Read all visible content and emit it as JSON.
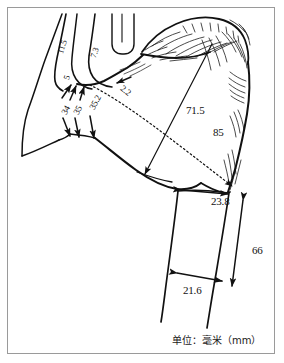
{
  "figure": {
    "frame_color": "#9a9a9a",
    "ink_color": "#111111",
    "background_color": "#ffffff",
    "units_caption": "单位：毫米（mm）"
  },
  "dimensions": [
    {
      "id": "d-11-5",
      "value": "11.5",
      "rotation": -72,
      "x": 56,
      "y": 52,
      "size": 8.5
    },
    {
      "id": "d-7-3",
      "value": "7.3",
      "rotation": -70,
      "x": 89,
      "y": 56,
      "size": 8.5
    },
    {
      "id": "d-5",
      "value": "5",
      "rotation": -72,
      "x": 62,
      "y": 78,
      "size": 8.5
    },
    {
      "id": "d-2-2",
      "value": "2.2",
      "rotation": 38,
      "x": 124,
      "y": 84,
      "size": 9
    },
    {
      "id": "d-34",
      "value": "34",
      "rotation": -62,
      "x": 60,
      "y": 112,
      "size": 9
    },
    {
      "id": "d-35",
      "value": "35",
      "rotation": -62,
      "x": 72,
      "y": 112,
      "size": 9
    },
    {
      "id": "d-35-2",
      "value": "35.2",
      "rotation": -62,
      "x": 88,
      "y": 107,
      "size": 9
    },
    {
      "id": "d-71-5",
      "value": "71.5",
      "rotation": 0,
      "x": 186,
      "y": 105,
      "size": 11
    },
    {
      "id": "d-85",
      "value": "85",
      "rotation": 0,
      "x": 213,
      "y": 127,
      "size": 11
    },
    {
      "id": "d-23-8",
      "value": "23.8",
      "rotation": 0,
      "x": 211,
      "y": 196,
      "size": 11
    },
    {
      "id": "d-66",
      "value": "66",
      "rotation": 0,
      "x": 252,
      "y": 245,
      "size": 11
    },
    {
      "id": "d-21-6",
      "value": "21.6",
      "rotation": 0,
      "x": 183,
      "y": 285,
      "size": 11
    }
  ]
}
